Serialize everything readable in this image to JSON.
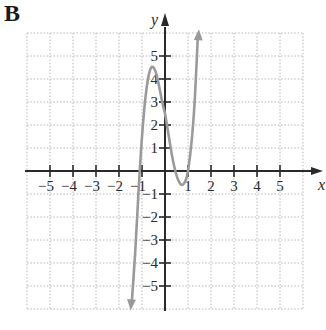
{
  "panel_label": "B",
  "chart_data": {
    "type": "line",
    "title": "",
    "panel_label": "B",
    "xlabel": "x",
    "ylabel": "y",
    "xlim": [
      -6,
      6
    ],
    "ylim": [
      -6,
      6
    ],
    "grid": true,
    "grid_style": "dotted",
    "x_ticks": [
      -5,
      -4,
      -3,
      -2,
      -1,
      1,
      2,
      3,
      4,
      5
    ],
    "y_ticks": [
      -5,
      -4,
      -3,
      -2,
      -1,
      1,
      2,
      3,
      4,
      5
    ],
    "x_tick_labels": [
      "−5",
      "−4",
      "−3",
      "−2",
      "−1",
      "1",
      "2",
      "3",
      "4",
      "5"
    ],
    "y_tick_labels": [
      "−5",
      "−4",
      "−3",
      "−2",
      "−1",
      "1",
      "2",
      "3",
      "4",
      "5"
    ],
    "series": [
      {
        "name": "cubic function",
        "color": "#9a9a9a",
        "arrows_at_ends": true,
        "description": "Cubic curve: rises from lower-left, local max near (-0.6, 4.5), local min near (0.75, -0.6), rises to upper-right",
        "x_intercepts": [
          -1.1,
          0.45,
          1.0
        ],
        "y_intercept": 2.5,
        "local_max": [
          -0.6,
          4.5
        ],
        "local_min": [
          0.75,
          -0.6
        ],
        "x": [
          -1.45,
          -1.3,
          -1.2,
          -1.1,
          -1.0,
          -0.9,
          -0.8,
          -0.7,
          -0.6,
          -0.5,
          -0.4,
          -0.3,
          -0.2,
          -0.1,
          0.0,
          0.1,
          0.2,
          0.3,
          0.45,
          0.6,
          0.75,
          0.9,
          1.0,
          1.1,
          1.2,
          1.3,
          1.43
        ],
        "y": [
          -5.8,
          -3.6,
          -1.8,
          0.0,
          1.5,
          2.7,
          3.6,
          4.2,
          4.5,
          4.5,
          4.3,
          3.9,
          3.4,
          2.9,
          2.5,
          1.9,
          1.3,
          0.7,
          0.0,
          -0.45,
          -0.6,
          -0.4,
          0.0,
          0.75,
          1.75,
          3.2,
          5.9
        ]
      }
    ]
  }
}
